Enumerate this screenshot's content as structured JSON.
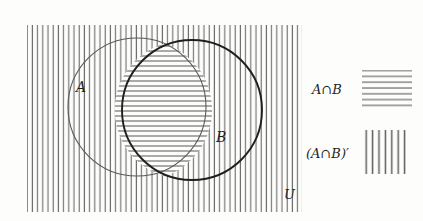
{
  "figure": {
    "type": "venn-diagram",
    "caption": "",
    "background_color": "#fdfdfc",
    "ink_color": "#2b2b2b"
  },
  "universal_set": {
    "label": "U",
    "shading": "vertical-lines",
    "meaning": "complement of A intersect B",
    "rect": {
      "x": 27,
      "y": 25,
      "width": 275,
      "height": 187
    }
  },
  "sets": [
    {
      "name": "A",
      "label": "A",
      "label_x": 76,
      "label_y": 92,
      "cx": 137,
      "cy": 107,
      "r": 69,
      "stroke_color": "#5a5a5a",
      "stroke_width": 1.1
    },
    {
      "name": "B",
      "label": "B",
      "label_x": 216,
      "label_y": 142,
      "cx": 192,
      "cy": 110,
      "r": 70,
      "stroke_color": "#1f1f1f",
      "stroke_width": 1.9
    }
  ],
  "intersection": {
    "label": "A∩B",
    "shading": "horizontal-lines",
    "fill_color": "#ffffff"
  },
  "hatching": {
    "vertical": {
      "spacing": 5.2,
      "stroke_width": 1.15,
      "color": "#6f6f6f"
    },
    "horizontal": {
      "spacing": 5.0,
      "stroke_width": 0.95,
      "color": "#4e4e4e"
    }
  },
  "legend": {
    "entries": [
      {
        "label": "A∩B",
        "swatch": "horizontal-lines",
        "swatch_line_count": 7,
        "label_x": 312,
        "label_y": 94,
        "swatch_x": 362,
        "swatch_y": 70,
        "swatch_width": 50,
        "swatch_height": 40
      },
      {
        "label": "(A∩B)′",
        "swatch": "vertical-lines",
        "swatch_line_count": 7,
        "label_x": 306,
        "label_y": 158,
        "swatch_x": 362,
        "swatch_y": 130,
        "swatch_width": 46,
        "swatch_height": 44
      }
    ]
  },
  "annotations": {
    "universe_label_x": 284,
    "universe_label_y": 199
  }
}
